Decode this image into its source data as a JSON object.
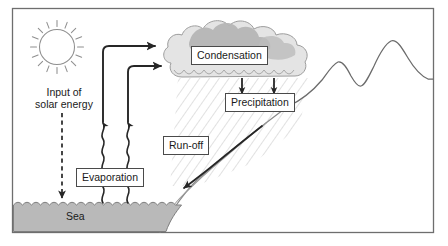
{
  "diagram": {
    "frame": {
      "border_color": "#6e6e6e",
      "background": "#ffffff"
    },
    "labels": {
      "condensation": "Condensation",
      "precipitation": "Precipitation",
      "runoff": "Run-off",
      "evaporation": "Evaporation",
      "sea": "Sea",
      "input_solar_energy": "Input of\nsolar energy"
    },
    "elements": {
      "sun": "sun-with-rays",
      "cloud": "cumulus-cloud",
      "mountain": "mountain-ridge-profile",
      "sea_body": "sea-water-body",
      "rain_hatching": "precipitation-hatch-lines"
    },
    "arrows": {
      "evaporation_wavy_left": "wavy-arrow-up",
      "evaporation_wavy_right": "wavy-arrow-up",
      "moisture_transport_upper": "elbow-arrow-right-to-cloud",
      "moisture_transport_lower": "elbow-arrow-right-to-cloud",
      "solar_energy_dashed": "dashed-arrow-down",
      "precipitation_left": "arrow-down",
      "precipitation_right": "arrow-down",
      "runoff_downslope": "arrow-down-left"
    },
    "colors": {
      "sea_fill": "#b9b9b9",
      "cloud_fill_light": "#e3e3e3",
      "cloud_fill_dark": "#b4b4b4",
      "line": "#3a3a3a",
      "hatch": "#c9c9c9",
      "sun_stroke": "#8d8d8d",
      "mountain_stroke": "#6b6b6b"
    }
  }
}
